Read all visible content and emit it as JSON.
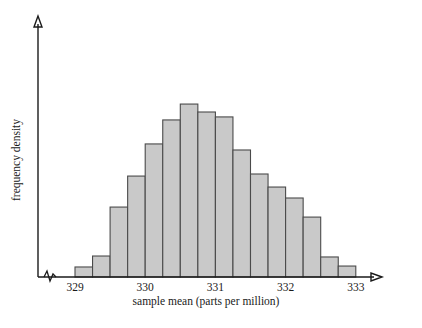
{
  "chart_data": {
    "type": "bar",
    "title": "",
    "subtitle": "",
    "xlabel": "sample mean (parts per million)",
    "ylabel": "frequency density",
    "xlim": [
      328.75,
      333.35
    ],
    "ylim": [
      0,
      1
    ],
    "grid": false,
    "legend": null,
    "bin_width": 0.25,
    "x_tick_labels": [
      "329",
      "330",
      "331",
      "332",
      "333"
    ],
    "x_tick_values": [
      329,
      330,
      331,
      332,
      333
    ],
    "y_tick_labels": [],
    "y_axis_broken": true,
    "bar_fill_color": "#c9c9c9",
    "bar_edge_color": "#4a4a4a",
    "axis_color": "#1a1a1a",
    "bins": [
      {
        "left": 329.0,
        "right": 329.25,
        "height": 0.053
      },
      {
        "left": 329.25,
        "right": 329.5,
        "height": 0.111
      },
      {
        "left": 329.5,
        "right": 329.75,
        "height": 0.37
      },
      {
        "left": 329.75,
        "right": 330.0,
        "height": 0.534
      },
      {
        "left": 330.0,
        "right": 330.25,
        "height": 0.704
      },
      {
        "left": 330.25,
        "right": 330.5,
        "height": 0.831
      },
      {
        "left": 330.5,
        "right": 330.75,
        "height": 0.915
      },
      {
        "left": 330.75,
        "right": 331.0,
        "height": 0.873
      },
      {
        "left": 331.0,
        "right": 331.25,
        "height": 0.847
      },
      {
        "left": 331.25,
        "right": 331.5,
        "height": 0.672
      },
      {
        "left": 331.5,
        "right": 331.75,
        "height": 0.545
      },
      {
        "left": 331.75,
        "right": 332.0,
        "height": 0.476
      },
      {
        "left": 332.0,
        "right": 332.25,
        "height": 0.418
      },
      {
        "left": 332.25,
        "right": 332.5,
        "height": 0.317
      },
      {
        "left": 332.5,
        "right": 332.75,
        "height": 0.106
      },
      {
        "left": 332.75,
        "right": 333.0,
        "height": 0.058
      }
    ]
  },
  "geometry": {
    "x_axis_y": 277,
    "y_axis_x": 38,
    "y_axis_top": 18,
    "x_axis_right": 382,
    "px_per_unit": 70.2,
    "x_origin_value": 329.0,
    "x_origin_px": 75.0,
    "bar_max_px": 189
  },
  "labels": {
    "x_axis_title": "sample mean (parts per million)",
    "y_axis_title": "frequency density"
  }
}
